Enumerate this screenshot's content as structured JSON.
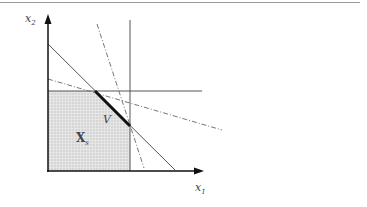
{
  "figure": {
    "axis_labels": {
      "x": "x",
      "x_sub": "1",
      "y": "x",
      "y_sub": "2"
    },
    "region_labels": {
      "feasible_set": "X",
      "feasible_set_sub": "s",
      "vertex_set": "V"
    },
    "colors": {
      "axis": "#111111",
      "constraint_line": "#555555",
      "dashdot_line": "#777777",
      "shading": "#d0d0d0",
      "highlight_segment": "#111111",
      "top_rule": "#999999"
    },
    "line_styles": {
      "solid_constraints": 3,
      "dash_dot_lines": 2,
      "highlighted_segment": "V"
    }
  }
}
